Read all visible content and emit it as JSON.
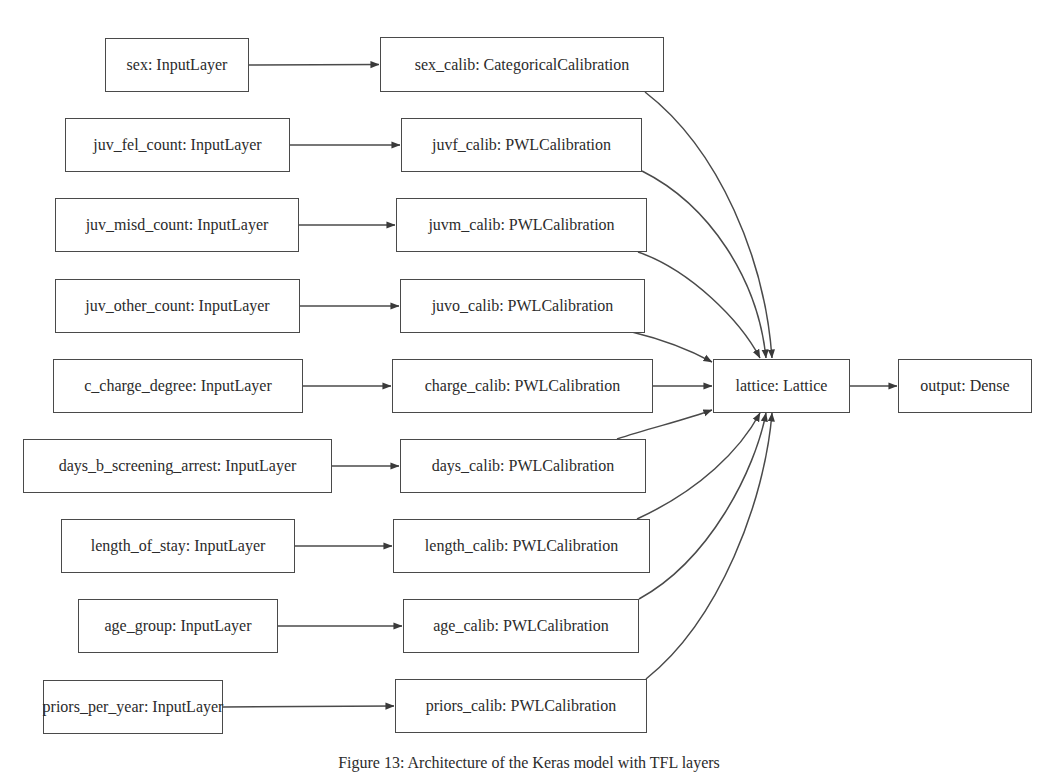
{
  "diagram": {
    "caption": "Figure 13: Architecture of the Keras model with TFL layers",
    "colors": {
      "stroke": "#4a4a4a",
      "text": "#2b2b2b",
      "background": "#ffffff"
    },
    "nodes": [
      {
        "id": "sex_input",
        "label": "sex: InputLayer",
        "x": 105,
        "y": 38,
        "w": 144,
        "h": 54
      },
      {
        "id": "juv_fel_input",
        "label": "juv_fel_count: InputLayer",
        "x": 65,
        "y": 118,
        "w": 225,
        "h": 54
      },
      {
        "id": "juv_misd_input",
        "label": "juv_misd_count: InputLayer",
        "x": 55,
        "y": 198,
        "w": 244,
        "h": 54
      },
      {
        "id": "juv_other_input",
        "label": "juv_other_count: InputLayer",
        "x": 55,
        "y": 279,
        "w": 245,
        "h": 54
      },
      {
        "id": "c_charge_input",
        "label": "c_charge_degree: InputLayer",
        "x": 53,
        "y": 359,
        "w": 250,
        "h": 54
      },
      {
        "id": "days_input",
        "label": "days_b_screening_arrest: InputLayer",
        "x": 23,
        "y": 439,
        "w": 309,
        "h": 54
      },
      {
        "id": "length_input",
        "label": "length_of_stay: InputLayer",
        "x": 61,
        "y": 519,
        "w": 234,
        "h": 54
      },
      {
        "id": "age_input",
        "label": "age_group: InputLayer",
        "x": 78,
        "y": 599,
        "w": 200,
        "h": 54
      },
      {
        "id": "priors_input",
        "label": "priors_per_year: InputLayer",
        "x": 43,
        "y": 680,
        "w": 180,
        "h": 54
      },
      {
        "id": "sex_calib",
        "label": "sex_calib: CategoricalCalibration",
        "x": 380,
        "y": 37,
        "w": 284,
        "h": 55
      },
      {
        "id": "juvf_calib",
        "label": "juvf_calib: PWLCalibration",
        "x": 401,
        "y": 118,
        "w": 241,
        "h": 54
      },
      {
        "id": "juvm_calib",
        "label": "juvm_calib: PWLCalibration",
        "x": 396,
        "y": 198,
        "w": 251,
        "h": 54
      },
      {
        "id": "juvo_calib",
        "label": "juvo_calib: PWLCalibration",
        "x": 400,
        "y": 279,
        "w": 245,
        "h": 54
      },
      {
        "id": "charge_calib",
        "label": "charge_calib: PWLCalibration",
        "x": 392,
        "y": 359,
        "w": 261,
        "h": 54
      },
      {
        "id": "days_calib",
        "label": "days_calib: PWLCalibration",
        "x": 400,
        "y": 439,
        "w": 246,
        "h": 54
      },
      {
        "id": "length_calib",
        "label": "length_calib: PWLCalibration",
        "x": 393,
        "y": 519,
        "w": 257,
        "h": 54
      },
      {
        "id": "age_calib",
        "label": "age_calib: PWLCalibration",
        "x": 403,
        "y": 599,
        "w": 236,
        "h": 54
      },
      {
        "id": "priors_calib",
        "label": "priors_calib: PWLCalibration",
        "x": 395,
        "y": 679,
        "w": 252,
        "h": 54
      },
      {
        "id": "lattice",
        "label": "lattice: Lattice",
        "x": 713,
        "y": 359,
        "w": 137,
        "h": 54
      },
      {
        "id": "output",
        "label": "output: Dense",
        "x": 898,
        "y": 359,
        "w": 134,
        "h": 54
      }
    ],
    "edges": [
      {
        "from": "sex_input",
        "to": "sex_calib"
      },
      {
        "from": "juv_fel_input",
        "to": "juvf_calib"
      },
      {
        "from": "juv_misd_input",
        "to": "juvm_calib"
      },
      {
        "from": "juv_other_input",
        "to": "juvo_calib"
      },
      {
        "from": "c_charge_input",
        "to": "charge_calib"
      },
      {
        "from": "days_input",
        "to": "days_calib"
      },
      {
        "from": "length_input",
        "to": "length_calib"
      },
      {
        "from": "age_input",
        "to": "age_calib"
      },
      {
        "from": "priors_input",
        "to": "priors_calib"
      },
      {
        "from": "sex_calib",
        "to": "lattice",
        "path": "M645,92 C720,150 765,260 772,358"
      },
      {
        "from": "juvf_calib",
        "to": "lattice",
        "path": "M642,171 C710,205 758,280 766,358"
      },
      {
        "from": "juvm_calib",
        "to": "lattice",
        "path": "M638,252 C690,270 740,320 760,358"
      },
      {
        "from": "juvo_calib",
        "to": "lattice",
        "path": "M632,332 C665,340 690,350 712,362"
      },
      {
        "from": "charge_calib",
        "to": "lattice",
        "path": "M653,386 L712,386"
      },
      {
        "from": "days_calib",
        "to": "lattice",
        "path": "M617,439 C650,428 685,420 712,410"
      },
      {
        "from": "length_calib",
        "to": "lattice",
        "path": "M637,519 C700,490 740,450 760,413"
      },
      {
        "from": "age_calib",
        "to": "lattice",
        "path": "M639,599 C710,560 755,470 766,413"
      },
      {
        "from": "priors_calib",
        "to": "lattice",
        "path": "M646,679 C720,620 765,500 772,413"
      },
      {
        "from": "lattice",
        "to": "output",
        "path": "M850,386 L897,386"
      }
    ]
  }
}
